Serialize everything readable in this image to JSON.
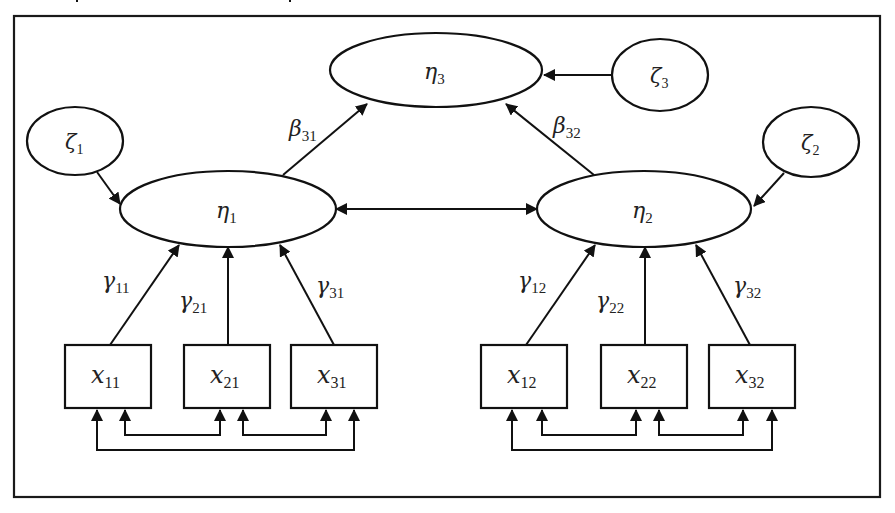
{
  "diagram": {
    "type": "structural-equation-path-diagram",
    "colors": {
      "stroke": "#111111",
      "background": "#ffffff",
      "text": "#222222"
    },
    "latent_endogenous": [
      {
        "id": "eta1",
        "symbol": "η",
        "sub": "1"
      },
      {
        "id": "eta2",
        "symbol": "η",
        "sub": "2"
      },
      {
        "id": "eta3",
        "symbol": "η",
        "sub": "3"
      }
    ],
    "disturbances": [
      {
        "id": "zeta1",
        "symbol": "ζ",
        "sub": "1",
        "target": "eta1"
      },
      {
        "id": "zeta2",
        "symbol": "ζ",
        "sub": "2",
        "target": "eta2"
      },
      {
        "id": "zeta3",
        "symbol": "ζ",
        "sub": "3",
        "target": "eta3"
      }
    ],
    "observed": [
      {
        "id": "x11",
        "symbol": "x",
        "sub": "11",
        "target": "eta1"
      },
      {
        "id": "x21",
        "symbol": "x",
        "sub": "21",
        "target": "eta1"
      },
      {
        "id": "x31",
        "symbol": "x",
        "sub": "31",
        "target": "eta1"
      },
      {
        "id": "x12",
        "symbol": "x",
        "sub": "12",
        "target": "eta2"
      },
      {
        "id": "x22",
        "symbol": "x",
        "sub": "22",
        "target": "eta2"
      },
      {
        "id": "x32",
        "symbol": "x",
        "sub": "32",
        "target": "eta2"
      }
    ],
    "paths": [
      {
        "id": "beta31",
        "symbol": "β",
        "sub": "31",
        "from": "eta1",
        "to": "eta3"
      },
      {
        "id": "beta32",
        "symbol": "β",
        "sub": "32",
        "from": "eta2",
        "to": "eta3"
      },
      {
        "id": "gamma11",
        "symbol": "γ",
        "sub": "11",
        "from": "x11",
        "to": "eta1"
      },
      {
        "id": "gamma21",
        "symbol": "γ",
        "sub": "21",
        "from": "x21",
        "to": "eta1"
      },
      {
        "id": "gamma31",
        "symbol": "γ",
        "sub": "31",
        "from": "x31",
        "to": "eta1"
      },
      {
        "id": "gamma12",
        "symbol": "γ",
        "sub": "12",
        "from": "x12",
        "to": "eta2"
      },
      {
        "id": "gamma22",
        "symbol": "γ",
        "sub": "22",
        "from": "x22",
        "to": "eta2"
      },
      {
        "id": "gamma32",
        "symbol": "γ",
        "sub": "32",
        "from": "x32",
        "to": "eta2"
      }
    ],
    "covariances": [
      {
        "between": [
          "eta1",
          "eta2"
        ]
      },
      {
        "between": [
          "x11",
          "x21"
        ]
      },
      {
        "between": [
          "x21",
          "x31"
        ]
      },
      {
        "between": [
          "x11",
          "x31"
        ]
      },
      {
        "between": [
          "x12",
          "x22"
        ]
      },
      {
        "between": [
          "x22",
          "x32"
        ]
      },
      {
        "between": [
          "x12",
          "x32"
        ]
      }
    ]
  }
}
